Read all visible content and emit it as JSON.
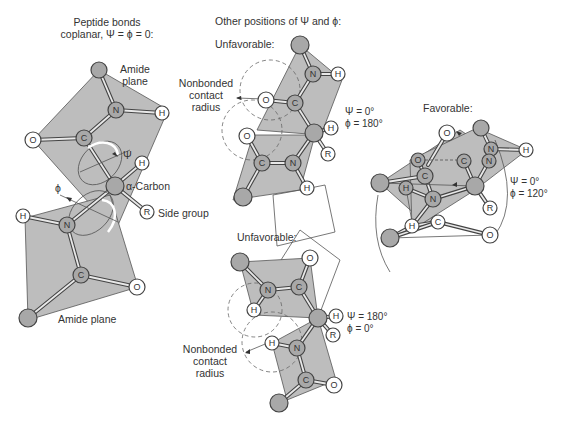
{
  "panels": {
    "coplanar": {
      "title_line1": "Peptide bonds",
      "title_line2": "coplanar, Ψ = ϕ = 0:",
      "amide_plane_top_line1": "Amide",
      "amide_plane_top_line2": "plane",
      "alpha_carbon": "α-Carbon",
      "side_group": "Side group",
      "psi_symbol": "Ψ",
      "phi_symbol": "ϕ",
      "amide_plane_bottom": "Amide plane"
    },
    "other_positions": {
      "title": "Other positions of Ψ and ϕ:"
    },
    "unfavorable_1": {
      "label": "Unfavorable:",
      "nonbonded_line1": "Nonbonded",
      "nonbonded_line2": "contact",
      "nonbonded_line3": "radius",
      "psi": "Ψ = 0°",
      "phi": "ϕ = 180°"
    },
    "favorable": {
      "label": "Favorable:",
      "psi": "Ψ = 0°",
      "phi": "ϕ = 120°"
    },
    "unfavorable_2": {
      "label": "Unfavorable:",
      "nonbonded_line1": "Nonbonded",
      "nonbonded_line2": "contact",
      "nonbonded_line3": "radius",
      "psi": "Ψ = 180°",
      "phi": "ϕ = 0°"
    }
  },
  "atoms": {
    "O": "O",
    "C": "C",
    "N": "N",
    "H": "H",
    "R": "R"
  },
  "colors": {
    "plane_fill": "#bdbdbd",
    "atom_gray": "#a8a8a8",
    "line": "#444444",
    "text": "#333333"
  }
}
